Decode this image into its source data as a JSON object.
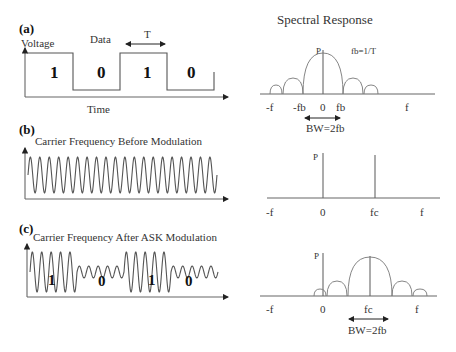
{
  "panels": {
    "a": {
      "label": "(a)",
      "y_axis_label": "Voltage",
      "data_label": "Data",
      "period_label": "T",
      "x_axis_label": "Time",
      "bits": [
        "1",
        "0",
        "1",
        "0"
      ],
      "spectrum": {
        "title": "Spectral Response",
        "peak_label": "P",
        "formula": "fb=1/T",
        "ticks": [
          "-f",
          "-fb",
          "0",
          "fb",
          "f"
        ],
        "bandwidth_label": "BW=2fb"
      }
    },
    "b": {
      "label": "(b)",
      "signal_title": "Carrier Frequency  Before Modulation",
      "carrier_cycles": 20,
      "spectrum": {
        "peak_label": "P",
        "ticks": [
          "-f",
          "0",
          "fc",
          "f"
        ]
      }
    },
    "c": {
      "label": "(c)",
      "signal_title": "Carrier Frequency  After ASK Modulation",
      "bits": [
        "1",
        "0",
        "1",
        "0"
      ],
      "high_amplitude_ratio": 1.0,
      "low_amplitude_ratio": 0.3,
      "spectrum": {
        "peak_label": "P",
        "ticks": [
          "-f",
          "0",
          "fc",
          "f"
        ],
        "bandwidth_label": "BW=2fb"
      }
    }
  }
}
